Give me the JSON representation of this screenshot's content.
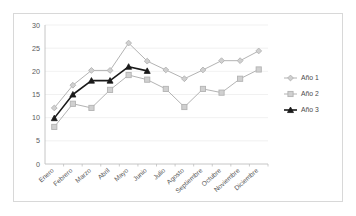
{
  "chart_data": {
    "type": "line",
    "title": "",
    "subtitle": "",
    "xlabel": "",
    "ylabel": "",
    "categories": [
      "Enero",
      "Febrero",
      "Marzo",
      "Abril",
      "Mayo",
      "Junio",
      "Julio",
      "Agosto",
      "Septiembre",
      "Octubre",
      "Noviembre",
      "Diciembre"
    ],
    "series": [
      {
        "name": "Año 1",
        "color": "#b3b3b3",
        "marker": "diamond",
        "values": [
          12.1,
          17.0,
          20.2,
          20.2,
          26.1,
          22.2,
          20.3,
          18.4,
          20.3,
          22.3,
          22.3,
          24.4
        ]
      },
      {
        "name": "Año 2",
        "color": "#b3b3b3",
        "marker": "square",
        "values": [
          8.0,
          13.0,
          12.1,
          16.0,
          19.2,
          18.2,
          16.2,
          12.3,
          16.2,
          15.4,
          18.4,
          20.4
        ]
      },
      {
        "name": "Año 3",
        "color": "#1a1a1a",
        "marker": "triangle",
        "values": [
          9.9,
          15.0,
          18.0,
          18.0,
          21.0,
          20.1,
          null,
          null,
          null,
          null,
          null,
          null
        ]
      }
    ],
    "yticks": [
      0,
      5,
      10,
      15,
      20,
      25,
      30
    ],
    "ylim": [
      0,
      30
    ],
    "grid": true,
    "grid_color": "#ededed",
    "legend_position": "right",
    "axis_color": "#bfbfbf",
    "text_color": "#5a5a5a"
  },
  "legend": {
    "entries": [
      {
        "label": "Año 1"
      },
      {
        "label": "Año 2"
      },
      {
        "label": "Año 3"
      }
    ]
  },
  "axis": {
    "y_tick_labels": [
      "30",
      "25",
      "20",
      "15",
      "10",
      "5",
      "0"
    ]
  }
}
